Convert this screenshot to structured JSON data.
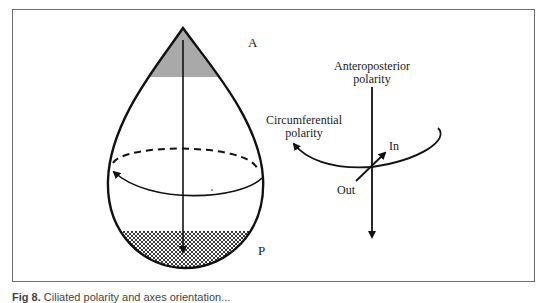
{
  "figure": {
    "labels": {
      "anterior": "A",
      "posterior": "P",
      "anteroposterior": [
        "Anteroposterior",
        "polarity"
      ],
      "circumferential": [
        "Circumferential",
        "polarity"
      ],
      "in": "In",
      "out": "Out"
    },
    "caption": {
      "figure_number": "Fig 8.",
      "text": "Ciliated polarity and axes orientation..."
    },
    "colors": {
      "ink": "#111111",
      "anterior_fill": "#a9a9a9",
      "frame": "#6e6e6e"
    }
  }
}
